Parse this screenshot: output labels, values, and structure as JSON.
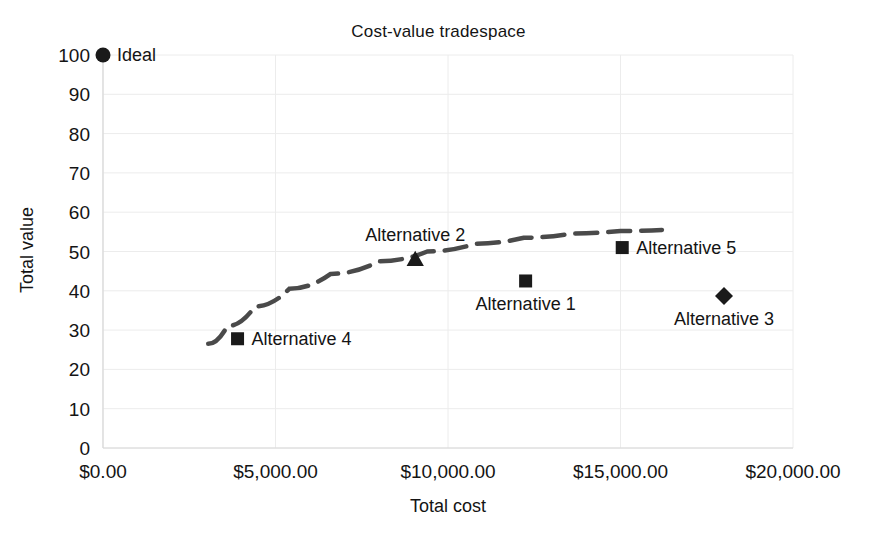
{
  "chart_data": {
    "type": "scatter",
    "title": "Cost-value tradespace",
    "xlabel": "Total cost",
    "ylabel": "Total value",
    "xlim": [
      0,
      20000
    ],
    "ylim": [
      0,
      100
    ],
    "grid": true,
    "legend": "none",
    "x_tick_labels": [
      "$0.00",
      "$5,000.00",
      "$10,000.00",
      "$15,000.00",
      "$20,000.00"
    ],
    "x_tick_values": [
      0,
      5000,
      10000,
      15000,
      20000
    ],
    "y_tick_labels": [
      "0",
      "10",
      "20",
      "30",
      "40",
      "50",
      "60",
      "70",
      "80",
      "90",
      "100"
    ],
    "y_tick_values": [
      0,
      10,
      20,
      30,
      40,
      50,
      60,
      70,
      80,
      90,
      100
    ],
    "points": [
      {
        "label": "Ideal",
        "x": 0,
        "y": 100,
        "marker": "circle",
        "label_pos": "right"
      },
      {
        "label": "Alternative 4",
        "x": 3900,
        "y": 27.8,
        "marker": "square",
        "label_pos": "right"
      },
      {
        "label": "Alternative 2",
        "x": 9050,
        "y": 48.0,
        "marker": "triangle",
        "label_pos": "above"
      },
      {
        "label": "Alternative 1",
        "x": 12250,
        "y": 42.5,
        "marker": "square",
        "label_pos": "below"
      },
      {
        "label": "Alternative 5",
        "x": 15050,
        "y": 51.0,
        "marker": "square",
        "label_pos": "right"
      },
      {
        "label": "Alternative 3",
        "x": 18000,
        "y": 38.7,
        "marker": "diamond",
        "label_pos": "below"
      }
    ],
    "pareto_frontier": {
      "name": "Pareto frontier",
      "style": "dashed",
      "color": "#4a4a4a",
      "x": [
        3050,
        3600,
        4400,
        5400,
        6600,
        8000,
        9400,
        10800,
        12200,
        13600,
        15000,
        16200
      ],
      "y": [
        26.5,
        31.0,
        36.0,
        40.5,
        44.3,
        47.5,
        50.0,
        52.0,
        53.5,
        54.6,
        55.2,
        55.5
      ]
    },
    "colors": {
      "marker": "#1a1a1a",
      "frontier": "#4a4a4a",
      "grid": "#ececec",
      "text": "#141414",
      "background": "#ffffff"
    }
  }
}
